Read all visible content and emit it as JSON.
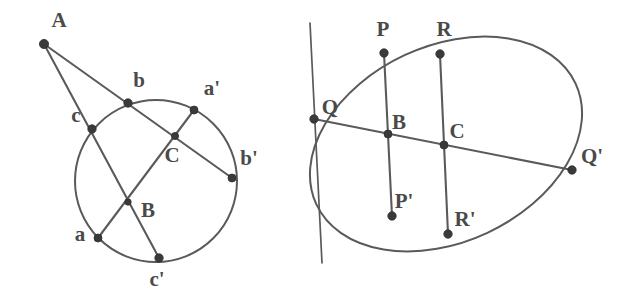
{
  "figure": {
    "stroke_color": "#5a5a5a",
    "label_color": "#4a4a4a",
    "dot_color": "#3a3a3a",
    "background": "#ffffff",
    "width": 622,
    "height": 296
  },
  "left_figure": {
    "name": "circle-construction",
    "shape": "circle",
    "circle": {
      "cx": 156,
      "cy": 181,
      "r": 81
    },
    "external_point": {
      "label": "A",
      "x": 44,
      "y": 44,
      "lx": 58,
      "ly": 23
    },
    "points": [
      {
        "label": "A",
        "x": 44,
        "y": 44,
        "lx": 59,
        "ly": 22,
        "r": 4.6,
        "size": "big"
      },
      {
        "label": "b",
        "x": 128,
        "y": 103,
        "lx": 139,
        "ly": 82,
        "r": 4.2,
        "size": "big"
      },
      {
        "label": "c",
        "x": 92,
        "y": 129,
        "lx": 76,
        "ly": 117,
        "r": 4.2,
        "size": "big"
      },
      {
        "label": "a'",
        "x": 194,
        "y": 110,
        "lx": 212,
        "ly": 90,
        "r": 4.0,
        "size": "big"
      },
      {
        "label": "C",
        "x": 175,
        "y": 136,
        "lx": 172,
        "ly": 157,
        "r": 3.6,
        "size": "big"
      },
      {
        "label": "b'",
        "x": 232,
        "y": 178,
        "lx": 249,
        "ly": 160,
        "r": 4.0,
        "size": "big"
      },
      {
        "label": "B",
        "x": 128,
        "y": 202,
        "lx": 148,
        "ly": 212,
        "r": 3.2,
        "size": "big"
      },
      {
        "label": "a",
        "x": 98,
        "y": 238,
        "lx": 80,
        "ly": 236,
        "r": 4.0,
        "size": "big"
      },
      {
        "label": "c'",
        "x": 159,
        "y": 258,
        "lx": 157,
        "ly": 281,
        "r": 4.2,
        "size": "big"
      }
    ],
    "chords": [
      {
        "name": "line-A-b-C-b-prime",
        "from": "A",
        "to": "b'",
        "x1": 44,
        "y1": 44,
        "x2": 232,
        "y2": 178
      },
      {
        "name": "line-A-c-B-c-prime",
        "from": "A",
        "to": "c'",
        "x1": 44,
        "y1": 44,
        "x2": 159,
        "y2": 258
      },
      {
        "name": "line-a-B-C-a-prime",
        "from": "a",
        "to": "a'",
        "x1": 98,
        "y1": 238,
        "x2": 194,
        "y2": 110
      }
    ]
  },
  "right_figure": {
    "name": "ellipse-construction",
    "shape": "ellipse",
    "ellipse": {
      "cx": 446,
      "cy": 144,
      "rx": 143,
      "ry": 98,
      "rotation": -25
    },
    "vertical_line": {
      "name": "tangent-line",
      "x1": 310,
      "y1": 23,
      "x2": 322,
      "y2": 263
    },
    "points": [
      {
        "label": "P",
        "x": 384,
        "y": 53,
        "lx": 383,
        "ly": 31,
        "r": 4.2,
        "size": "big"
      },
      {
        "label": "R",
        "x": 440,
        "y": 54,
        "lx": 444,
        "ly": 31,
        "r": 4.2,
        "size": "big"
      },
      {
        "label": "Q",
        "x": 314,
        "y": 119,
        "lx": 330,
        "ly": 109,
        "r": 4.2,
        "size": "big"
      },
      {
        "label": "B",
        "x": 388,
        "y": 134,
        "lx": 399,
        "ly": 124,
        "r": 4.0,
        "size": "big"
      },
      {
        "label": "C",
        "x": 444,
        "y": 145,
        "lx": 457,
        "ly": 133,
        "r": 4.0,
        "size": "big"
      },
      {
        "label": "Q'",
        "x": 572,
        "y": 170,
        "lx": 592,
        "ly": 158,
        "r": 4.2,
        "size": "big"
      },
      {
        "label": "P'",
        "x": 392,
        "y": 216,
        "lx": 404,
        "ly": 203,
        "r": 4.2,
        "size": "big"
      },
      {
        "label": "R'",
        "x": 448,
        "y": 234,
        "lx": 465,
        "ly": 221,
        "r": 4.2,
        "size": "big"
      }
    ],
    "chords": [
      {
        "name": "chord-P-P-prime",
        "from": "P",
        "to": "P'",
        "x1": 384,
        "y1": 53,
        "x2": 392,
        "y2": 216
      },
      {
        "name": "chord-R-R-prime",
        "from": "R",
        "to": "R'",
        "x1": 440,
        "y1": 54,
        "x2": 448,
        "y2": 234
      },
      {
        "name": "chord-Q-Q-prime",
        "from": "Q",
        "to": "Q'",
        "x1": 314,
        "y1": 119,
        "x2": 572,
        "y2": 170
      }
    ]
  }
}
